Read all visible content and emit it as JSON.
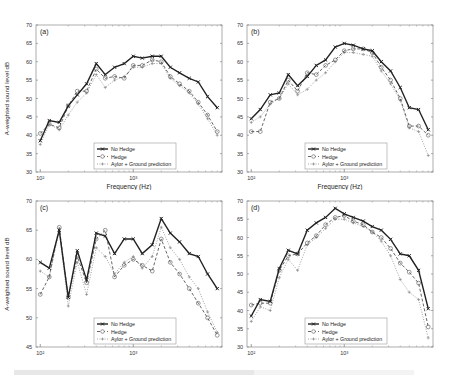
{
  "figure": {
    "frequencies_hz": [
      100,
      125,
      160,
      200,
      250,
      315,
      400,
      500,
      630,
      800,
      1000,
      1250,
      1600,
      2000,
      2500,
      3150,
      4000,
      5000,
      6300,
      8000
    ],
    "legend": [
      "No Hedge",
      "Hedge",
      "Aylor + Ground prediction"
    ],
    "xlabel": "Frequency (Hz)",
    "ylabel": "A-weighted sound level dB",
    "xticks": [
      "10²",
      "10³"
    ],
    "colors": {
      "no_hedge": "#222222",
      "hedge": "#555555",
      "aylor": "#8a8a8a",
      "frame": "#444444",
      "grid": "#cccccc"
    }
  },
  "chart_data": [
    {
      "type": "line",
      "title": "(a)",
      "xlabel": "Frequency (Hz)",
      "ylabel": "A-weighted sound level dB",
      "xscale": "log",
      "xlim": [
        90,
        9000
      ],
      "ylim": [
        30,
        70
      ],
      "yticks": [
        30,
        35,
        40,
        45,
        50,
        55,
        60,
        65,
        70
      ],
      "legend_position": "lower center",
      "x": [
        100,
        125,
        160,
        200,
        250,
        315,
        400,
        500,
        630,
        800,
        1000,
        1250,
        1600,
        2000,
        2500,
        3150,
        4000,
        5000,
        6300,
        8000
      ],
      "series": [
        {
          "name": "No Hedge",
          "values": [
            38.5,
            44,
            43.5,
            48,
            51,
            54,
            59.5,
            56.5,
            58.5,
            59.5,
            61.5,
            61,
            61.5,
            61.5,
            58.5,
            57,
            55.5,
            54.5,
            50.5,
            47.5
          ]
        },
        {
          "name": "Hedge",
          "values": [
            40.5,
            43,
            42,
            48,
            52,
            52,
            58,
            55.5,
            56,
            55.5,
            59,
            59,
            60.5,
            60,
            56,
            54,
            52,
            49,
            45.5,
            41
          ]
        },
        {
          "name": "Aylor + Ground prediction",
          "values": [
            37.5,
            43,
            41.5,
            45.5,
            49,
            51.5,
            56.5,
            53,
            55,
            56,
            58.5,
            58.5,
            59.5,
            59.5,
            55.5,
            53.5,
            51.5,
            48.5,
            44.5,
            40
          ]
        }
      ]
    },
    {
      "type": "line",
      "title": "(b)",
      "xlabel": "Frequency (Hz)",
      "ylabel": "",
      "xscale": "log",
      "xlim": [
        90,
        9000
      ],
      "ylim": [
        30,
        70
      ],
      "yticks": [
        30,
        35,
        40,
        45,
        50,
        55,
        60,
        65,
        70
      ],
      "legend_position": "lower center",
      "x": [
        100,
        125,
        160,
        200,
        250,
        315,
        400,
        500,
        630,
        800,
        1000,
        1250,
        1600,
        2000,
        2500,
        3150,
        4000,
        5000,
        6300,
        8000
      ],
      "series": [
        {
          "name": "No Hedge",
          "values": [
            44.5,
            47,
            51,
            51.5,
            56.5,
            53.5,
            56,
            59,
            60.5,
            64,
            65,
            64.5,
            63.5,
            63,
            60,
            57.5,
            53,
            47.5,
            47,
            41.5
          ]
        },
        {
          "name": "Hedge",
          "values": [
            41,
            41,
            49,
            50,
            55,
            52,
            57,
            56.5,
            59,
            60.5,
            63,
            63.5,
            63.5,
            62.5,
            58.5,
            55,
            50,
            42.5,
            42.5,
            40
          ]
        },
        {
          "name": "Aylor + Ground prediction",
          "values": [
            43.5,
            45,
            48.5,
            50,
            54,
            51,
            52.5,
            55,
            57,
            60,
            62.5,
            62.5,
            62,
            61.5,
            57.5,
            54,
            49.5,
            42,
            41,
            34.5
          ]
        }
      ]
    },
    {
      "type": "line",
      "title": "(c)",
      "xlabel": "Frequency (Hz)",
      "ylabel": "A-weighted sound level dB",
      "xscale": "log",
      "xlim": [
        90,
        9000
      ],
      "ylim": [
        45,
        70
      ],
      "yticks": [
        45,
        50,
        55,
        60,
        65,
        70
      ],
      "legend_position": "lower center",
      "x": [
        100,
        125,
        160,
        200,
        250,
        315,
        400,
        500,
        630,
        800,
        1000,
        1250,
        1600,
        2000,
        2500,
        3150,
        4000,
        5000,
        6300,
        8000
      ],
      "series": [
        {
          "name": "No Hedge",
          "values": [
            59.5,
            58.5,
            65,
            53.5,
            61.5,
            56.5,
            64.5,
            64,
            61,
            63.5,
            63.5,
            61,
            62.5,
            67,
            64.5,
            63,
            61,
            60.5,
            57.5,
            55
          ]
        },
        {
          "name": "Hedge",
          "values": [
            54,
            57,
            65.5,
            53.5,
            60.5,
            56,
            63.5,
            65,
            57,
            59,
            60,
            59,
            58,
            63.5,
            59.5,
            57.5,
            55,
            52.5,
            50,
            47
          ]
        },
        {
          "name": "Aylor + Ground prediction",
          "values": [
            58,
            57,
            65,
            52,
            59.5,
            54,
            62,
            60.5,
            57.5,
            59.5,
            60.5,
            58.5,
            60.5,
            65.5,
            62,
            60,
            57,
            55,
            51,
            47.5
          ]
        }
      ]
    },
    {
      "type": "line",
      "title": "(d)",
      "xlabel": "Frequency (Hz)",
      "ylabel": "",
      "xscale": "log",
      "xlim": [
        90,
        9000
      ],
      "ylim": [
        30,
        70
      ],
      "yticks": [
        30,
        35,
        40,
        45,
        50,
        55,
        60,
        65,
        70
      ],
      "legend_position": "lower center",
      "x": [
        100,
        125,
        160,
        200,
        250,
        315,
        400,
        500,
        630,
        800,
        1000,
        1250,
        1600,
        2000,
        2500,
        3150,
        4000,
        5000,
        6300,
        8000
      ],
      "series": [
        {
          "name": "No Hedge",
          "values": [
            38.5,
            43,
            42.5,
            51.5,
            56.5,
            55.5,
            62,
            64,
            65.5,
            68,
            66.5,
            65.5,
            64.5,
            63,
            62,
            59.5,
            55.5,
            55,
            51,
            40.5
          ]
        },
        {
          "name": "Hedge",
          "values": [
            41.5,
            42,
            42,
            51,
            55,
            55.5,
            58.5,
            60.5,
            63.5,
            65.5,
            66,
            64.5,
            63.5,
            61.5,
            60,
            57,
            53,
            50.5,
            47.5,
            35.5
          ]
        },
        {
          "name": "Aylor + Ground prediction",
          "values": [
            37,
            41,
            40,
            49,
            54,
            51,
            58,
            60,
            62.5,
            65,
            65,
            64,
            63,
            61.5,
            59,
            55,
            48.5,
            45,
            43,
            32.5
          ]
        }
      ]
    }
  ]
}
